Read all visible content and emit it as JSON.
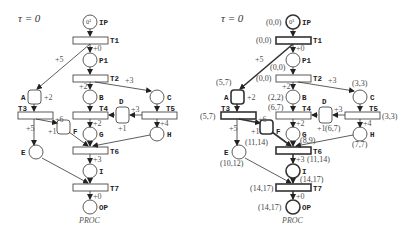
{
  "left": {
    "title": "τ = 0",
    "caption": "PROC",
    "places": {
      "IP": {
        "label": "IP",
        "token": "0¹"
      },
      "P1": {
        "label": "P1"
      },
      "A": {
        "label": "A"
      },
      "B": {
        "label": "B"
      },
      "C": {
        "label": "C"
      },
      "D": {
        "label": "D"
      },
      "E": {
        "label": "E"
      },
      "F": {
        "label": "F"
      },
      "G": {
        "label": "G"
      },
      "H": {
        "label": "H"
      },
      "I": {
        "label": "I"
      },
      "OP": {
        "label": "OP"
      }
    },
    "transitions": {
      "T1": "T1",
      "T2": "T2",
      "T3": "T3",
      "T4": "T4",
      "T5": "T5",
      "T6": "T6",
      "T7": "T7"
    },
    "weights": {
      "t1_p1": "+0",
      "t1_a": "+5",
      "t2_b": "+2",
      "t2_c": "+3",
      "a": "+2",
      "t3_f": "+6",
      "t3_e": "+5",
      "f": "+1",
      "t5_d": "+3",
      "d": "+1",
      "t4_g": "+2",
      "t5_h": "+4",
      "t6_i": "+3",
      "t7_op": "+0"
    }
  },
  "right": {
    "title": "τ = 0",
    "caption": "PROC",
    "places": {
      "IP": {
        "label": "IP",
        "token": "0¹",
        "time": "(0,0)"
      },
      "P1": {
        "label": "P1",
        "time": "(0,0)"
      },
      "A": {
        "label": "A",
        "time": "(5,7)"
      },
      "B": {
        "label": "B",
        "time": "(2,2)"
      },
      "C": {
        "label": "C",
        "time": "(3,3)"
      },
      "D": {
        "label": "D",
        "time": "(6,7)"
      },
      "E": {
        "label": "E",
        "time": "(10,12)"
      },
      "F": {
        "label": "F",
        "time": "(11,14)"
      },
      "G": {
        "label": "G",
        "time": "(8,9)"
      },
      "H": {
        "label": "H",
        "time": "(7,7)"
      },
      "I": {
        "label": "I",
        "time": "(14,17)"
      },
      "OP": {
        "label": "OP",
        "time": "(14,17)"
      }
    },
    "transitions": {
      "T1": {
        "label": "T1",
        "time": "(0,0)"
      },
      "T2": {
        "label": "T2",
        "time": "(0,0)"
      },
      "T3": {
        "label": "T3",
        "time": "(5,7)"
      },
      "T4": {
        "label": "T4",
        "time": "(6,7)"
      },
      "T5": {
        "label": "T5",
        "time": "(3,3)"
      },
      "T6": {
        "label": "T6",
        "time": "(11,14)"
      },
      "T7": {
        "label": "T7",
        "time": "(14,17)"
      }
    },
    "weights": {
      "t1_p1": "+0",
      "t1_a": "+5",
      "t2_b": "+2",
      "t2_c": "+3",
      "a": "+2",
      "t3_f": "+6",
      "t3_e": "+5",
      "f": "+1",
      "t5_d": "+3",
      "d": "+1",
      "t4_g": "+2",
      "t5_h": "+4",
      "t6_i": "+3",
      "t7_op": "+0"
    }
  }
}
